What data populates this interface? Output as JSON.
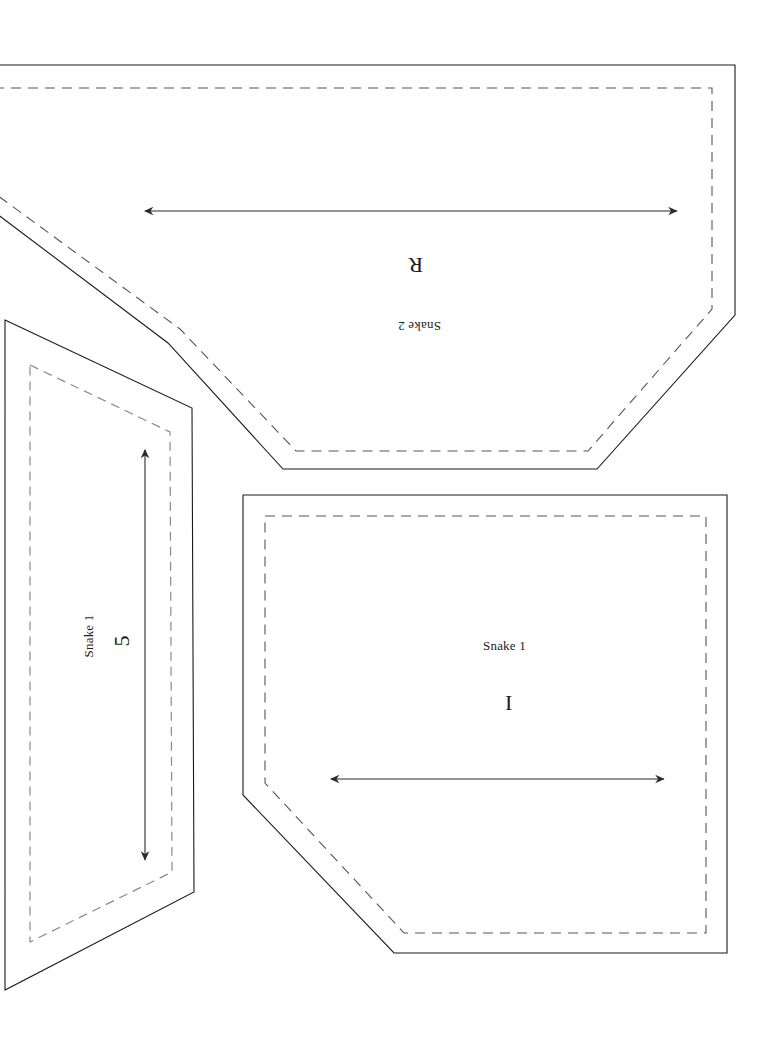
{
  "page": {
    "background_color": "#ffffff",
    "width": 770,
    "height": 1037
  },
  "style": {
    "cut_line_color": "#1a1a1a",
    "fold_line_color": "#555555",
    "fill_gray": "#d4d4d4",
    "arrow_color": "#2b2b2b"
  },
  "panels": [
    {
      "id": "panel-snake-2",
      "name": "Snake 2 panel",
      "label": "Snake 2",
      "marker": "R",
      "rotation": 180,
      "filled": false,
      "cut_path": "M -40,65 L 735,65 L 735,315 L 597,469 L 283,469 L 168,343 L -40,186 Z",
      "fold_path": "M -40,88 L 712,88 L 712,309 L 588,451 L 296,451 L 180,329 L -40,168 Z"
    },
    {
      "id": "panel-snake-1-right",
      "name": "Snake 1 right panel",
      "label": "Snake 1",
      "marker": "I",
      "rotation": 0,
      "filled": false,
      "cut_path": "M 243,495 L 727,495 L 727,953 L 394,953 L 243,795 Z",
      "fold_path": "M 265,516 L 706,516 L 706,933 L 404,933 L 265,783 Z"
    },
    {
      "id": "panel-snake-1-left",
      "name": "Snake 1 left panel",
      "label": "Snake 1",
      "marker": "5",
      "rotation": -90,
      "filled": true,
      "cut_path": "M 5,320 L 192,408 L 194,892 L 5,990 Z",
      "fold_path": "M 30,365 L 170,432 L 172,872 L 30,942 Z"
    }
  ],
  "dimension_arrows": [
    {
      "id": "arrow-top",
      "name": "Snake 2 width dimension arrow",
      "orientation": "horizontal",
      "x1": 145,
      "y1": 211,
      "x2": 677,
      "y2": 211
    },
    {
      "id": "arrow-bottom",
      "name": "Snake 1 width dimension arrow",
      "orientation": "horizontal",
      "x1": 331,
      "y1": 779,
      "x2": 664,
      "y2": 779
    },
    {
      "id": "arrow-left-vertical",
      "name": "Snake 1 height dimension arrow",
      "orientation": "vertical",
      "x1": 145,
      "y1": 450,
      "x2": 145,
      "y2": 860
    }
  ],
  "text_items": [
    {
      "id": "text-snake-2-name",
      "name": "snake-2-name-label",
      "value": "Snake 2",
      "left": 398,
      "top": 318,
      "size": "small",
      "rotation": 180
    },
    {
      "id": "text-snake-2-marker",
      "name": "snake-2-marker-label",
      "value": "R",
      "left": 408,
      "top": 252,
      "size": "big",
      "rotation": 180
    },
    {
      "id": "text-snake-1-right-name",
      "name": "snake-1-right-name-label",
      "value": "Snake 1",
      "left": 483,
      "top": 638,
      "size": "small",
      "rotation": 0
    },
    {
      "id": "text-snake-1-right-marker",
      "name": "snake-1-right-marker-label",
      "value": "I",
      "left": 505,
      "top": 690,
      "size": "big",
      "rotation": 0
    },
    {
      "id": "text-snake-1-left-name",
      "name": "snake-1-left-name-label",
      "value": "Snake 1",
      "left": 68,
      "top": 628,
      "size": "small",
      "rotation": -90
    },
    {
      "id": "text-snake-1-left-marker",
      "name": "snake-1-left-marker-label",
      "value": "5",
      "left": 116,
      "top": 628,
      "size": "big",
      "rotation": -90
    }
  ]
}
